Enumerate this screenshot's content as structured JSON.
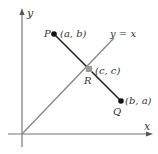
{
  "diagram": {
    "axes": {
      "x_label": "x",
      "y_label": "y",
      "color": "#777777"
    },
    "line_y_eq_x": {
      "label": "y = x",
      "color": "#888888"
    },
    "segment_PQ": {
      "color": "#222222"
    },
    "points": [
      {
        "name": "P",
        "coord_label": "(a, b)",
        "color": "#111111"
      },
      {
        "name": "R",
        "coord_label": "(c, c)",
        "color": "#999999"
      },
      {
        "name": "Q",
        "coord_label": "(b, a)",
        "color": "#111111"
      }
    ]
  }
}
